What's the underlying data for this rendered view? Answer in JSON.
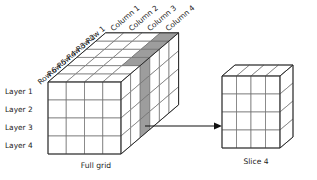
{
  "diagram": {
    "title_visible": false,
    "background_color": "#ffffff",
    "line_color": "#6e6e6e",
    "outline_color": "#2b2b2b",
    "shade_color": "#9d9d9d",
    "text_color": "#1a1a1a"
  },
  "full_grid": {
    "caption": "Full grid",
    "rows_count": 6,
    "columns_count": 4,
    "layers_count": 4,
    "row_labels": [
      "Row 1",
      "Row 2",
      "Row 3",
      "Row 4",
      "Row 5",
      "Row 6"
    ],
    "column_labels": [
      "Column 1",
      "Column 2",
      "Column 3",
      "Column 4"
    ],
    "layer_labels": [
      "Layer 1",
      "Layer 2",
      "Layer 3",
      "Layer 4"
    ],
    "highlighted_slice_index": 4,
    "highlighted_slice_orientation": "vertical-column-slice"
  },
  "slice": {
    "caption": "Slice 4",
    "rows_count": 4,
    "columns_count": 4
  },
  "arrow": {
    "name": "slice-extraction-arrow",
    "direction": "left-to-right",
    "from": "Full grid",
    "to": "Slice 4"
  }
}
